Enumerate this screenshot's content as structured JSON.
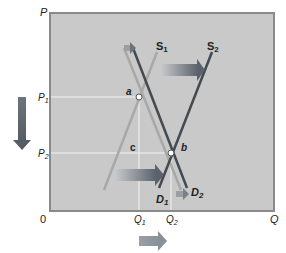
{
  "diagram": {
    "axes": {
      "y_label": "P",
      "x_label": "Q",
      "origin_label": "0",
      "y_ticks": [
        {
          "label": "P",
          "sub": "1",
          "y": 97
        },
        {
          "label": "P",
          "sub": "2",
          "y": 153
        }
      ],
      "x_ticks": [
        {
          "label": "Q",
          "sub": "1",
          "x": 139
        },
        {
          "label": "Q",
          "sub": "2",
          "x": 171
        }
      ]
    },
    "curves": {
      "s1": {
        "label": "S",
        "sub": "1"
      },
      "s2": {
        "label": "S",
        "sub": "2"
      },
      "d1": {
        "label": "D",
        "sub": "1"
      },
      "d2": {
        "label": "D",
        "sub": "2"
      }
    },
    "points": {
      "a": "a",
      "b": "b",
      "c": "c"
    },
    "arrows": [
      {
        "name": "supply-shift-arrow",
        "direction": "right"
      },
      {
        "name": "demand-shift-arrow-top",
        "direction": "right"
      },
      {
        "name": "demand-shift-arrow-bottom",
        "direction": "right"
      },
      {
        "name": "price-decrease-arrow",
        "direction": "down"
      },
      {
        "name": "quantity-increase-arrow",
        "direction": "right"
      }
    ],
    "colors": {
      "plot_bg": "#c9c9c9",
      "plot_border": "#8a8a8a",
      "supply_line": "#444a52",
      "demand_line_light": "#a8a8a8",
      "arrow": "#5f6670",
      "arrow_light": "#a0a5ab",
      "guide_line": "#f2f2f2"
    }
  }
}
